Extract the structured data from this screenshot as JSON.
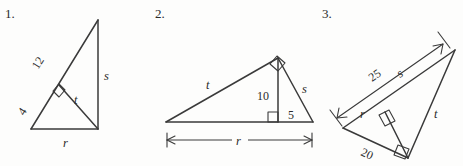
{
  "page": {
    "background_color": "#fdfdfc",
    "ink_color": "#3a3a3a",
    "width": 463,
    "height": 166
  },
  "figures": [
    {
      "number": "1.",
      "description": "Right triangle with hypotenuse split by an altitude; vertical leg on the right.",
      "labels": {
        "hypotenuse_upper": "12",
        "hypotenuse_lower": "4",
        "altitude": "t",
        "vertical_leg": "s",
        "base": "r"
      },
      "right_angle_markers": 1
    },
    {
      "number": "2.",
      "description": "Obtuse-looking triangle with apex right angle and a vertical altitude to the base; base dimensioned with arrows.",
      "labels": {
        "left_side": "t",
        "altitude": "10",
        "right_segment": "5",
        "right_side": "s",
        "base_dimension": "r"
      },
      "right_angle_markers": 2
    },
    {
      "number": "3.",
      "description": "Tilted right triangle with altitude to hypotenuse; hypotenuse dimensioned with a double arrow.",
      "labels": {
        "hypotenuse_dimension": "25",
        "hypotenuse_part": "s",
        "altitude": "r",
        "short_leg": "20",
        "long_leg": "t"
      },
      "right_angle_markers": 2
    }
  ]
}
